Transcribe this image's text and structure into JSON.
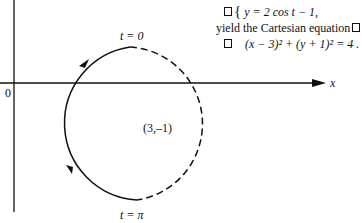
{
  "equations": {
    "line1": "y = 2 cos t − 1,",
    "line2": "yield the Cartesian equation",
    "line3": "(x − 3)² + (y + 1)² = 4 ."
  },
  "diagram": {
    "axis_x_label": "x",
    "origin_label": "0",
    "center_label": "(3,–1)",
    "t0_label": "t = 0",
    "tpi_label": "t = π",
    "colors": {
      "stroke": "#111111",
      "background": "#ffffff"
    }
  }
}
